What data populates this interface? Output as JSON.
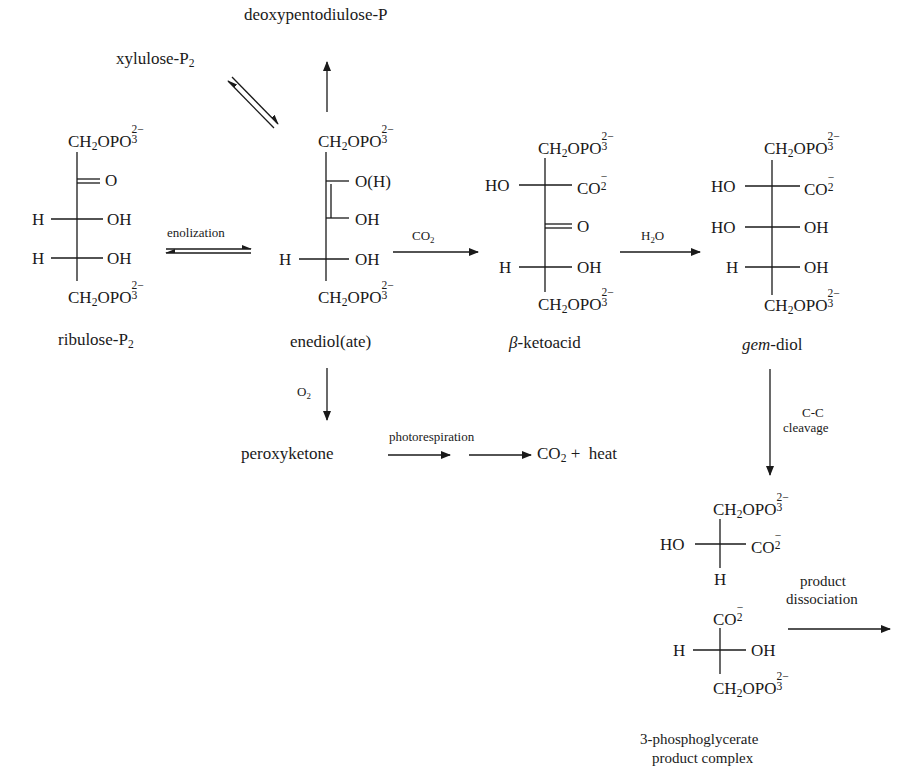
{
  "compounds": {
    "ribulose": {
      "name": "ribulose-P",
      "name_sub": "2",
      "top": "CH2OPO3 2-",
      "rows": [
        {
          "left": "",
          "right": "O",
          "bond": "double"
        },
        {
          "left": "H",
          "right": "OH"
        },
        {
          "left": "H",
          "right": "OH"
        }
      ],
      "bottom": "CH2OPO3 2-"
    },
    "enediol": {
      "name": "enediol(ate)",
      "rows": [
        {
          "left": "",
          "right": "O(H)"
        },
        {
          "left": "",
          "right": "OH"
        },
        {
          "left": "H",
          "right": "OH"
        }
      ]
    },
    "ketoacid": {
      "name_prefix": "β",
      "name_rest": "-ketoacid",
      "rows": [
        {
          "left": "HO",
          "right": "CO2-"
        },
        {
          "left": "",
          "right": "O",
          "bond": "double"
        },
        {
          "left": "H",
          "right": "OH"
        }
      ]
    },
    "gemdiol": {
      "name_italic": "gem",
      "name_rest": "-diol",
      "rows": [
        {
          "left": "HO",
          "right": "CO2-"
        },
        {
          "left": "HO",
          "right": "OH"
        },
        {
          "left": "H",
          "right": "OH"
        }
      ]
    },
    "product_upper": {
      "left": "HO",
      "right": "CO2-",
      "bottom": "H"
    },
    "product_lower": {
      "left": "H",
      "right": "OH"
    },
    "product_complex": {
      "line1": "3-phosphoglycerate",
      "line2": "product complex"
    },
    "xylulose": {
      "name": "xylulose-P",
      "name_sub": "2"
    },
    "deoxy": {
      "name": "deoxypentodiulose-P"
    },
    "peroxyketone": {
      "name": "peroxyketone"
    },
    "final": {
      "co2": "CO",
      "co2_sub": "2",
      "plus": "+",
      "heat": "heat"
    }
  },
  "labels": {
    "ch2": "CH",
    "h2_sub": "2",
    "opo": "OPO",
    "three": "3",
    "charge2": "2−",
    "co": "CO",
    "two": "2",
    "minus": "−"
  },
  "reagents": {
    "enolization": "enolization",
    "co2": "CO",
    "co2_sub": "2",
    "h2o_h": "H",
    "h2o_sub": "2",
    "h2o_o": "O",
    "o2": "O",
    "o2_sub": "2",
    "photorespiration": "photorespiration",
    "cleavage_1": "C-C",
    "cleavage_2": "cleavage",
    "dissociation_1": "product",
    "dissociation_2": "dissociation"
  }
}
